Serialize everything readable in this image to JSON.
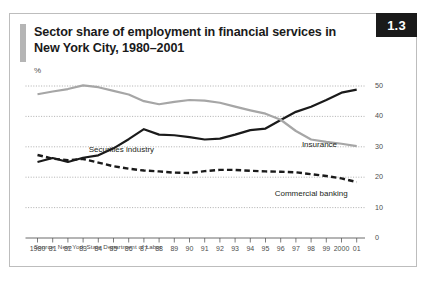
{
  "figure": {
    "badge": "1.3",
    "title_line1": "Sector share of employment in financial services in",
    "title_line2": "New York City, 1980–2001",
    "unit": "%",
    "source": "Source: New York State Department of Labor"
  },
  "colors": {
    "securities": "#1a1a1a",
    "insurance": "#a6a6a6",
    "commercial_banking": "#1a1a1a",
    "badge_bg": "#1a1a1a",
    "badge_text": "#ffffff",
    "accent_bar": "#b5b5b5",
    "grid": "#8c8c8c",
    "border": "#bdbdbd",
    "text": "#231f20"
  },
  "chart_data": {
    "type": "line",
    "title": "Sector share of employment in financial services in New York City, 1980–2001",
    "xlabel": "",
    "ylabel": "%",
    "ylim": [
      0,
      50
    ],
    "yticks": [
      0,
      10,
      20,
      30,
      40,
      50
    ],
    "grid": "horizontal-dotted",
    "legend": "inline-annotations",
    "categories": [
      "1980",
      "81",
      "82",
      "83",
      "84",
      "85",
      "86",
      "87",
      "88",
      "89",
      "90",
      "91",
      "92",
      "93",
      "94",
      "95",
      "96",
      "97",
      "98",
      "99",
      "2000",
      "01"
    ],
    "series": [
      {
        "name": "Securities industry",
        "style": "solid",
        "color": "#1a1a1a",
        "label_x": "81",
        "values": [
          25.0,
          26.3,
          25.0,
          26.4,
          27.2,
          29.5,
          32.5,
          35.8,
          34.0,
          33.8,
          33.2,
          32.4,
          32.7,
          34.0,
          35.5,
          36.0,
          38.8,
          41.5,
          43.2,
          45.4,
          47.8,
          48.8
        ]
      },
      {
        "name": "Insurance",
        "style": "solid",
        "color": "#a6a6a6",
        "label_x": "97",
        "values": [
          47.3,
          48.2,
          49.0,
          50.2,
          49.6,
          48.4,
          47.2,
          45.0,
          44.0,
          44.8,
          45.4,
          45.2,
          44.5,
          43.2,
          42.0,
          40.9,
          38.9,
          35.2,
          32.4,
          31.6,
          31.0,
          30.2
        ]
      },
      {
        "name": "Commercial banking",
        "style": "dashed",
        "color": "#1a1a1a",
        "label_x": "96",
        "values": [
          27.3,
          26.1,
          25.6,
          26.0,
          24.8,
          23.6,
          22.8,
          22.2,
          21.9,
          21.5,
          21.4,
          22.0,
          22.4,
          22.4,
          22.1,
          21.9,
          21.8,
          21.6,
          21.0,
          20.4,
          19.6,
          18.4
        ]
      }
    ]
  }
}
